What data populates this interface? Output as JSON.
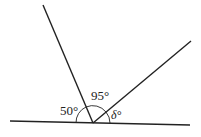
{
  "diagram": {
    "type": "angles-on-a-straight-line",
    "labels": {
      "left_angle": "50°",
      "middle_angle": "95°",
      "right_angle": "δ°"
    },
    "colors": {
      "line": "#222222",
      "background": "#ffffff"
    }
  }
}
